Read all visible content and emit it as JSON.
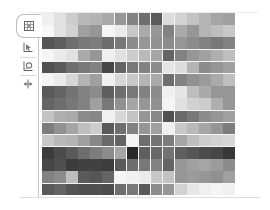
{
  "tabs": [
    {
      "name": "tab-heatmap",
      "icon": "grid-icon",
      "selected": true
    },
    {
      "name": "tab-chart",
      "icon": "chart-pointer-icon",
      "selected": false
    },
    {
      "name": "tab-image",
      "icon": "image-search-icon",
      "selected": false
    },
    {
      "name": "tab-split",
      "icon": "split-arrows-icon",
      "selected": false
    }
  ],
  "chart_data": {
    "type": "heatmap",
    "title": "",
    "rows": 15,
    "cols": 16,
    "colormap": "grayscale (0=black, 255=white)",
    "values": [
      [
        240,
        225,
        205,
        185,
        180,
        170,
        150,
        130,
        110,
        90,
        220,
        210,
        195,
        180,
        165,
        160
      ],
      [
        248,
        225,
        210,
        160,
        150,
        245,
        235,
        200,
        170,
        150,
        130,
        170,
        150,
        180,
        190,
        200
      ],
      [
        85,
        95,
        110,
        120,
        125,
        110,
        120,
        140,
        150,
        145,
        140,
        150,
        140,
        130,
        120,
        130
      ],
      [
        245,
        235,
        225,
        170,
        150,
        240,
        225,
        205,
        185,
        165,
        100,
        130,
        150,
        160,
        175,
        190
      ],
      [
        80,
        90,
        110,
        120,
        130,
        70,
        100,
        120,
        130,
        140,
        230,
        220,
        180,
        140,
        150,
        160
      ],
      [
        245,
        235,
        215,
        180,
        160,
        240,
        215,
        200,
        180,
        170,
        110,
        130,
        145,
        155,
        170,
        190
      ],
      [
        90,
        100,
        115,
        130,
        140,
        95,
        110,
        120,
        130,
        140,
        240,
        230,
        190,
        170,
        150,
        150
      ],
      [
        100,
        110,
        120,
        130,
        160,
        120,
        145,
        165,
        150,
        145,
        245,
        225,
        210,
        205,
        175,
        150
      ],
      [
        195,
        175,
        170,
        140,
        135,
        240,
        215,
        195,
        150,
        135,
        80,
        105,
        120,
        140,
        150,
        160
      ],
      [
        125,
        145,
        165,
        190,
        205,
        90,
        110,
        130,
        150,
        160,
        240,
        200,
        185,
        165,
        150,
        125
      ],
      [
        200,
        185,
        180,
        160,
        135,
        105,
        100,
        245,
        110,
        115,
        125,
        165,
        190,
        205,
        210,
        215
      ],
      [
        60,
        75,
        90,
        110,
        125,
        140,
        165,
        40,
        95,
        105,
        115,
        95,
        85,
        75,
        70,
        55
      ],
      [
        70,
        80,
        60,
        65,
        65,
        60,
        90,
        110,
        120,
        130,
        100,
        150,
        160,
        165,
        155,
        140
      ],
      [
        130,
        140,
        190,
        90,
        85,
        100,
        245,
        240,
        235,
        200,
        195,
        150,
        155,
        150,
        145,
        160
      ],
      [
        90,
        100,
        85,
        80,
        80,
        75,
        110,
        120,
        90,
        140,
        150,
        210,
        230,
        240,
        245,
        240
      ]
    ],
    "xlabel": "",
    "ylabel": "",
    "grid": true,
    "legend": "none"
  }
}
